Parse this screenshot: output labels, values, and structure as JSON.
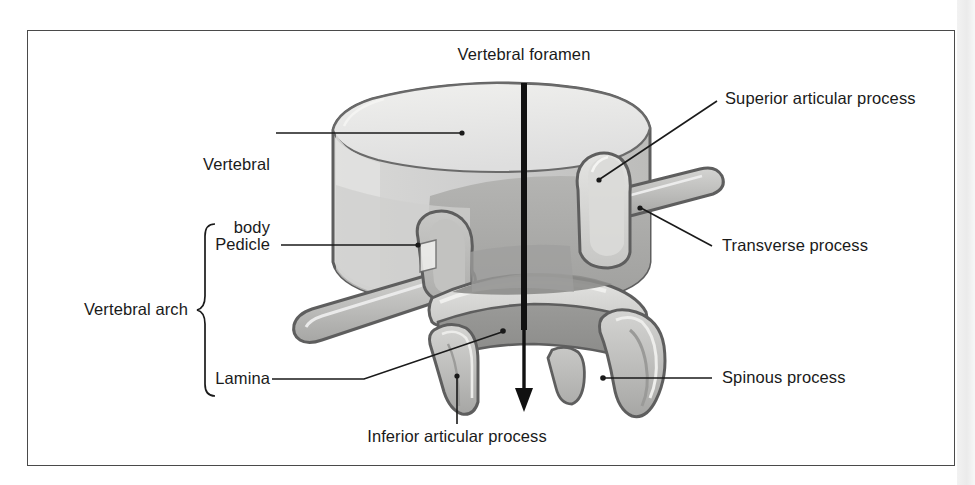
{
  "figure": {
    "subject": "vertebra",
    "view": "oblique three-quarter view of a typical vertebra",
    "frame_border_color": "#4a4a4a",
    "background_color": "#ffffff",
    "text_color": "#1a1a1a",
    "leader_line_color": "#1a1a1a"
  },
  "labels": {
    "vertebral_foramen": "Vertebral foramen",
    "superior_articular_process": "Superior articular process",
    "transverse_process": "Transverse process",
    "spinous_process": "Spinous process",
    "vertebral_body_line1": "Vertebral",
    "vertebral_body_line2": "body",
    "pedicle": "Pedicle",
    "lamina": "Lamina",
    "vertebral_arch": "Vertebral arch",
    "inferior_articular_process": "Inferior articular process"
  },
  "illustration": {
    "palette": {
      "outline": "#5e5e5e",
      "body_top_light": "#e8e8e6",
      "body_front_mid": "#c9c9c7",
      "body_shadow": "#a8a8a6",
      "arch_light": "#dcdcda",
      "arch_mid": "#bdbdbb",
      "arch_dark": "#9e9e9c",
      "interior_dark": "#8f8f8d",
      "highlight": "#f2f2f0"
    },
    "parts": [
      "vertebral body",
      "pedicle",
      "lamina",
      "superior articular process",
      "inferior articular process",
      "transverse process (left)",
      "transverse process (right)",
      "spinous process"
    ]
  },
  "annotations": {
    "foramen_axis_arrow": {
      "description": "vertical black arrow passing through the vertebral foramen pointing downward",
      "color": "#111111"
    },
    "arch_brace": {
      "description": "curly brace grouping Pedicle and Lamina under Vertebral arch"
    }
  }
}
